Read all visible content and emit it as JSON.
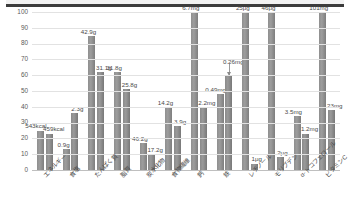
{
  "chart_data": {
    "type": "bar",
    "title": "",
    "subtitle": "",
    "xlabel": "",
    "ylabel": "",
    "ylim": [
      0,
      100
    ],
    "yticks": [
      0,
      10,
      20,
      30,
      40,
      50,
      60,
      70,
      80,
      90,
      100
    ],
    "grid": true,
    "legend": "none",
    "categories": [
      "エネルギー",
      "食塩",
      "たんぱく質",
      "脂質",
      "炭水化物",
      "食物繊維",
      "鈣",
      "鉄",
      "レチノール",
      "モリブデン",
      "α-トコフェロール",
      "ビタミンC"
    ],
    "series": [
      {
        "name": "series-1",
        "values": [
          25,
          13,
          85,
          62,
          17,
          40,
          100,
          48,
          100,
          100,
          34,
          100
        ],
        "labels": [
          "543kcal",
          "0.9g",
          "42.9g",
          "31.8g",
          "46.2g",
          "14.2g",
          "6.7mg",
          "0.49mg",
          "25μg",
          "46μg",
          "3.5mg",
          "101mg"
        ]
      },
      {
        "name": "series-2",
        "values": [
          23,
          36,
          62,
          51,
          10,
          28,
          40,
          60,
          4,
          8,
          23,
          38
        ],
        "labels": [
          "459kcal",
          "2.3g",
          "31.1g",
          "25.8g",
          "17.2g",
          "3.9g",
          "2.2mg",
          "0.26mg",
          "1μg",
          "2μg",
          "1.2mg",
          "23mg"
        ]
      }
    ],
    "annotations": [
      {
        "text": "0.26mg",
        "attached_to": "鉄",
        "style": "leader-arrow"
      }
    ],
    "colors": {
      "bar_1": "#8f8f8f",
      "bar_2": "#8a8a8a",
      "grid": "#e2e2e2",
      "axis": "#bfbfbf",
      "header_rule": "#3c3c3c",
      "text": "#4a4a4a",
      "background": "#ffffff"
    }
  }
}
